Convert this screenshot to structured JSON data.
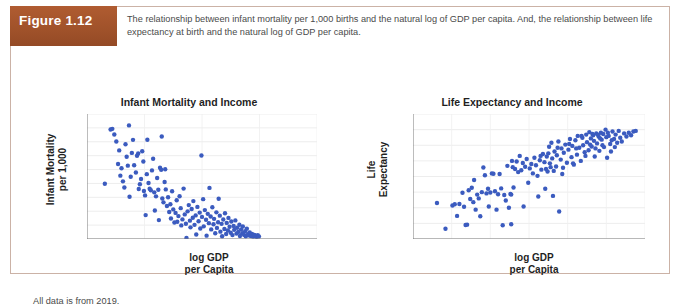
{
  "figure": {
    "badge_label": "Figure 1.12",
    "caption": "The relationship between infant mortality per 1,000 births and the natural log of GDP per capita. And, the relationship between life expectancy at birth and the natural log of GDP per capita.",
    "footer_note": "All data is from 2019.",
    "badge_color": "#a4542c",
    "border_color": "#cbb2a6",
    "marker_color": "#3b5bbf"
  },
  "chart_data": [
    {
      "type": "scatter",
      "id": "infant-mortality-and-income",
      "title": "Infant Mortality and Income",
      "xlabel": "log GDP\nper Capita",
      "xlabel_line1": "log GDP",
      "xlabel_line2": "per Capita",
      "ylabel": "Infant Mortality\nper 1,000",
      "ylabel_line1": "Infant Mortality",
      "ylabel_line2": "per 1,000",
      "xlim": [
        6,
        14
      ],
      "ylim": [
        0,
        90
      ],
      "xticks": [
        6,
        8,
        10,
        12,
        14
      ],
      "yticks": [
        0,
        10,
        20,
        30,
        40,
        50,
        60,
        70,
        80,
        90
      ],
      "grid": true,
      "legend": "none",
      "marker_color": "#3b5bbf",
      "points": [
        [
          6.62,
          39.8
        ],
        [
          6.82,
          78.8
        ],
        [
          6.88,
          79.3
        ],
        [
          6.95,
          75.2
        ],
        [
          7.02,
          70.2
        ],
        [
          7.08,
          54.0
        ],
        [
          7.12,
          63.8
        ],
        [
          7.16,
          45.6
        ],
        [
          7.2,
          50.9
        ],
        [
          7.25,
          41.5
        ],
        [
          7.3,
          37.1
        ],
        [
          7.34,
          68.2
        ],
        [
          7.38,
          59.2
        ],
        [
          7.42,
          52.8
        ],
        [
          7.46,
          81.8
        ],
        [
          7.48,
          30.4
        ],
        [
          7.52,
          44.8
        ],
        [
          7.56,
          62.0
        ],
        [
          7.6,
          71.4
        ],
        [
          7.64,
          53.1
        ],
        [
          7.7,
          47.9
        ],
        [
          7.74,
          59.9
        ],
        [
          7.78,
          61.6
        ],
        [
          7.8,
          36.0
        ],
        [
          7.84,
          39.4
        ],
        [
          7.88,
          43.2
        ],
        [
          7.92,
          63.2
        ],
        [
          7.96,
          55.8
        ],
        [
          7.98,
          34.6
        ],
        [
          8.02,
          31.4
        ],
        [
          8.04,
          17.2
        ],
        [
          8.08,
          46.7
        ],
        [
          8.1,
          71.5
        ],
        [
          8.14,
          40.3
        ],
        [
          8.18,
          36.2
        ],
        [
          8.22,
          35.1
        ],
        [
          8.26,
          49.4
        ],
        [
          8.3,
          57.8
        ],
        [
          8.34,
          33.6
        ],
        [
          8.36,
          20.5
        ],
        [
          8.4,
          30.7
        ],
        [
          8.44,
          43.9
        ],
        [
          8.48,
          35.5
        ],
        [
          8.5,
          13.6
        ],
        [
          8.54,
          51.3
        ],
        [
          8.58,
          49.9
        ],
        [
          8.6,
          73.8
        ],
        [
          8.62,
          29.2
        ],
        [
          8.66,
          26.4
        ],
        [
          8.7,
          41.0
        ],
        [
          8.72,
          50.2
        ],
        [
          8.74,
          35.7
        ],
        [
          8.78,
          23.8
        ],
        [
          8.82,
          30.1
        ],
        [
          8.86,
          19.4
        ],
        [
          8.9,
          25.0
        ],
        [
          8.92,
          14.8
        ],
        [
          8.96,
          34.4
        ],
        [
          9.0,
          21.3
        ],
        [
          9.04,
          11.9
        ],
        [
          9.08,
          18.8
        ],
        [
          9.12,
          27.9
        ],
        [
          9.14,
          12.4
        ],
        [
          9.18,
          16.5
        ],
        [
          9.22,
          30.8
        ],
        [
          9.26,
          22.2
        ],
        [
          9.28,
          9.8
        ],
        [
          9.32,
          14.1
        ],
        [
          9.36,
          36.3
        ],
        [
          9.4,
          17.7
        ],
        [
          9.44,
          11.0
        ],
        [
          9.46,
          0.8
        ],
        [
          9.5,
          19.9
        ],
        [
          9.54,
          24.4
        ],
        [
          9.58,
          13.2
        ],
        [
          9.6,
          8.4
        ],
        [
          9.64,
          21.6
        ],
        [
          9.68,
          15.3
        ],
        [
          9.7,
          27.3
        ],
        [
          9.74,
          10.2
        ],
        [
          9.78,
          17.0
        ],
        [
          9.8,
          3.2
        ],
        [
          9.84,
          23.1
        ],
        [
          9.88,
          12.8
        ],
        [
          9.92,
          19.0
        ],
        [
          9.94,
          7.6
        ],
        [
          9.98,
          60.1
        ],
        [
          10.0,
          15.9
        ],
        [
          10.04,
          28.7
        ],
        [
          10.06,
          9.1
        ],
        [
          10.1,
          20.8
        ],
        [
          10.14,
          13.9
        ],
        [
          10.16,
          2.4
        ],
        [
          10.2,
          18.1
        ],
        [
          10.24,
          11.4
        ],
        [
          10.26,
          36.8
        ],
        [
          10.3,
          16.2
        ],
        [
          10.32,
          6.9
        ],
        [
          10.36,
          22.9
        ],
        [
          10.4,
          10.6
        ],
        [
          10.42,
          14.5
        ],
        [
          10.46,
          4.1
        ],
        [
          10.5,
          19.2
        ],
        [
          10.52,
          8.0
        ],
        [
          10.56,
          12.1
        ],
        [
          10.58,
          29.0
        ],
        [
          10.62,
          16.8
        ],
        [
          10.64,
          5.3
        ],
        [
          10.68,
          10.9
        ],
        [
          10.7,
          2.0
        ],
        [
          10.74,
          14.0
        ],
        [
          10.78,
          7.2
        ],
        [
          10.8,
          18.5
        ],
        [
          10.84,
          3.6
        ],
        [
          10.86,
          11.6
        ],
        [
          10.9,
          6.1
        ],
        [
          10.92,
          15.2
        ],
        [
          10.96,
          8.8
        ],
        [
          11.0,
          4.5
        ],
        [
          11.02,
          12.6
        ],
        [
          11.06,
          2.8
        ],
        [
          11.1,
          9.4
        ],
        [
          11.12,
          6.6
        ],
        [
          11.16,
          13.4
        ],
        [
          11.2,
          3.9
        ],
        [
          11.22,
          8.1
        ],
        [
          11.26,
          5.0
        ],
        [
          11.3,
          10.3
        ],
        [
          11.32,
          2.2
        ],
        [
          11.36,
          6.8
        ],
        [
          11.4,
          4.2
        ],
        [
          11.42,
          9.0
        ],
        [
          11.46,
          3.0
        ],
        [
          11.5,
          5.6
        ],
        [
          11.52,
          1.9
        ],
        [
          11.56,
          7.4
        ],
        [
          11.6,
          3.4
        ],
        [
          11.62,
          2.6
        ],
        [
          11.66,
          4.8
        ],
        [
          11.7,
          2.1
        ],
        [
          11.74,
          3.7
        ],
        [
          11.78,
          1.7
        ],
        [
          11.82,
          2.9
        ],
        [
          11.86,
          2.3
        ],
        [
          11.9,
          1.5
        ],
        [
          11.94,
          2.7
        ],
        [
          11.98,
          1.8
        ]
      ]
    },
    {
      "type": "scatter",
      "id": "life-expectancy-and-income",
      "title": "Life Expectancy and Income",
      "xlabel": "log GDP\nper Capita",
      "xlabel_line1": "log GDP",
      "xlabel_line2": "per Capita",
      "ylabel": "Life\nExpectancy",
      "ylabel_line1": "Life",
      "ylabel_line2": "Expectancy",
      "xlim": [
        6,
        12
      ],
      "ylim": [
        50,
        90
      ],
      "xticks": [
        6,
        7,
        8,
        9,
        10,
        11,
        12
      ],
      "yticks": [
        50,
        55,
        60,
        65,
        70,
        75,
        80,
        85,
        90
      ],
      "grid": true,
      "legend": "none",
      "marker_color": "#3b5bbf",
      "points": [
        [
          6.62,
          61.5
        ],
        [
          6.84,
          53.3
        ],
        [
          7.02,
          60.7
        ],
        [
          7.08,
          61.1
        ],
        [
          7.14,
          57.4
        ],
        [
          7.2,
          61.2
        ],
        [
          7.28,
          64.8
        ],
        [
          7.32,
          60.3
        ],
        [
          7.36,
          54.5
        ],
        [
          7.4,
          54.6
        ],
        [
          7.44,
          65.6
        ],
        [
          7.48,
          62.8
        ],
        [
          7.52,
          66.4
        ],
        [
          7.56,
          61.8
        ],
        [
          7.58,
          68.9
        ],
        [
          7.62,
          59.4
        ],
        [
          7.66,
          64.2
        ],
        [
          7.7,
          63.0
        ],
        [
          7.74,
          57.3
        ],
        [
          7.78,
          65.0
        ],
        [
          7.82,
          72.9
        ],
        [
          7.86,
          70.4
        ],
        [
          7.9,
          64.6
        ],
        [
          7.94,
          66.1
        ],
        [
          7.96,
          60.4
        ],
        [
          8.0,
          64.9
        ],
        [
          8.04,
          71.0
        ],
        [
          8.08,
          70.9
        ],
        [
          8.12,
          65.3
        ],
        [
          8.16,
          59.4
        ],
        [
          8.2,
          64.3
        ],
        [
          8.24,
          70.8
        ],
        [
          8.28,
          66.2
        ],
        [
          8.32,
          54.4
        ],
        [
          8.36,
          64.1
        ],
        [
          8.4,
          62.3
        ],
        [
          8.44,
          73.4
        ],
        [
          8.48,
          60.0
        ],
        [
          8.52,
          64.4
        ],
        [
          8.54,
          54.7
        ],
        [
          8.56,
          75.0
        ],
        [
          8.6,
          66.5
        ],
        [
          8.64,
          72.4
        ],
        [
          8.68,
          74.8
        ],
        [
          8.72,
          71.4
        ],
        [
          8.76,
          76.6
        ],
        [
          8.8,
          72.0
        ],
        [
          8.84,
          74.3
        ],
        [
          8.86,
          60.4
        ],
        [
          8.9,
          73.1
        ],
        [
          8.94,
          75.6
        ],
        [
          8.98,
          68.0
        ],
        [
          9.02,
          72.6
        ],
        [
          9.06,
          74.0
        ],
        [
          9.1,
          71.0
        ],
        [
          9.14,
          76.0
        ],
        [
          9.18,
          73.6
        ],
        [
          9.22,
          70.2
        ],
        [
          9.24,
          63.6
        ],
        [
          9.28,
          75.2
        ],
        [
          9.32,
          72.2
        ],
        [
          9.36,
          77.2
        ],
        [
          9.4,
          74.6
        ],
        [
          9.42,
          66.1
        ],
        [
          9.46,
          76.4
        ],
        [
          9.48,
          71.6
        ],
        [
          9.52,
          79.5
        ],
        [
          9.54,
          74.2
        ],
        [
          9.58,
          80.8
        ],
        [
          9.6,
          75.8
        ],
        [
          9.62,
          63.8
        ],
        [
          9.66,
          78.0
        ],
        [
          9.7,
          73.2
        ],
        [
          9.72,
          76.8
        ],
        [
          9.76,
          81.2
        ],
        [
          9.78,
          58.8
        ],
        [
          9.82,
          75.4
        ],
        [
          9.84,
          79.0
        ],
        [
          9.88,
          72.8
        ],
        [
          9.9,
          77.6
        ],
        [
          9.94,
          80.2
        ],
        [
          9.98,
          74.4
        ],
        [
          10.02,
          78.6
        ],
        [
          10.06,
          82.0
        ],
        [
          10.1,
          76.2
        ],
        [
          10.12,
          79.8
        ],
        [
          10.16,
          73.8
        ],
        [
          10.2,
          81.6
        ],
        [
          10.24,
          77.0
        ],
        [
          10.26,
          83.0
        ],
        [
          10.3,
          79.2
        ],
        [
          10.34,
          75.0
        ],
        [
          10.38,
          82.4
        ],
        [
          10.4,
          80.0
        ],
        [
          10.44,
          77.8
        ],
        [
          10.48,
          83.4
        ],
        [
          10.5,
          81.0
        ],
        [
          10.54,
          78.4
        ],
        [
          10.56,
          84.2
        ],
        [
          10.6,
          82.2
        ],
        [
          10.62,
          79.6
        ],
        [
          10.66,
          83.2
        ],
        [
          10.68,
          81.4
        ],
        [
          10.7,
          76.4
        ],
        [
          10.74,
          83.8
        ],
        [
          10.76,
          80.6
        ],
        [
          10.8,
          82.8
        ],
        [
          10.82,
          78.2
        ],
        [
          10.86,
          84.0
        ],
        [
          10.88,
          81.8
        ],
        [
          10.92,
          83.6
        ],
        [
          10.94,
          79.4
        ],
        [
          10.98,
          85.0
        ],
        [
          11.0,
          82.6
        ],
        [
          11.02,
          76.0
        ],
        [
          11.06,
          83.0
        ],
        [
          11.1,
          80.4
        ],
        [
          11.12,
          78.0
        ],
        [
          11.16,
          84.4
        ],
        [
          11.2,
          82.0
        ],
        [
          11.24,
          83.4
        ],
        [
          11.28,
          80.8
        ],
        [
          11.32,
          84.6
        ],
        [
          11.36,
          82.4
        ],
        [
          11.4,
          81.2
        ],
        [
          11.46,
          83.8
        ],
        [
          11.52,
          82.8
        ],
        [
          11.58,
          84.0
        ],
        [
          11.64,
          83.2
        ],
        [
          11.7,
          84.4
        ],
        [
          11.76,
          84.6
        ],
        [
          8.54,
          64.2
        ],
        [
          8.58,
          73.0
        ],
        [
          9.3,
          76.6
        ],
        [
          9.44,
          72.4
        ],
        [
          9.5,
          77.4
        ],
        [
          9.56,
          73.0
        ],
        [
          9.64,
          71.8
        ],
        [
          9.74,
          79.2
        ],
        [
          9.86,
          70.8
        ],
        [
          10.04,
          80.4
        ],
        [
          10.14,
          74.2
        ],
        [
          10.22,
          79.0
        ],
        [
          10.36,
          83.0
        ],
        [
          10.46,
          76.6
        ],
        [
          10.58,
          80.2
        ],
        [
          10.64,
          83.6
        ],
        [
          10.72,
          79.0
        ],
        [
          10.78,
          83.4
        ],
        [
          10.84,
          82.2
        ],
        [
          10.9,
          80.0
        ],
        [
          11.04,
          84.0
        ],
        [
          11.14,
          81.6
        ],
        [
          11.22,
          79.4
        ]
      ]
    }
  ]
}
